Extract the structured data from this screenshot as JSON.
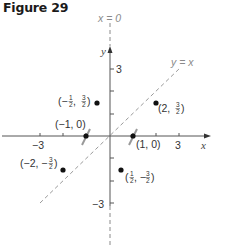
{
  "figure": {
    "title": "Figure 29"
  },
  "axes": {
    "x_label": "x",
    "y_label": "y",
    "x_ticks": [
      "−3",
      "3"
    ],
    "y_ticks": [
      "3",
      "−3"
    ]
  },
  "lines": {
    "vertical_line_label": "x = 0",
    "diagonal_line_label": "y = x"
  },
  "points": [
    {
      "label_main": "(1, 0)",
      "x": 1,
      "y": 0
    },
    {
      "label_main": "(−1, 0)",
      "x": -1,
      "y": 0
    },
    {
      "label_open": "(2, ",
      "num": "3",
      "den": "2",
      "label_close": ")",
      "x": 2,
      "y": 1.5
    },
    {
      "label_open": "(−",
      "num": "1",
      "den": "2",
      "mid": ", ",
      "num2": "3",
      "den2": "2",
      "label_close": ")",
      "x": -0.5,
      "y": 1.5
    },
    {
      "label_open": "(−2, −",
      "num": "3",
      "den": "2",
      "label_close": ")",
      "x": -2,
      "y": -1.5
    },
    {
      "label_open": "(",
      "num": "1",
      "den": "2",
      "mid": ", −",
      "num2": "3",
      "den2": "2",
      "label_close": ")",
      "x": 0.5,
      "y": -1.5
    }
  ],
  "colors": {
    "axis": "#555555",
    "dashed": "#9a9a9a",
    "point": "#111111"
  }
}
